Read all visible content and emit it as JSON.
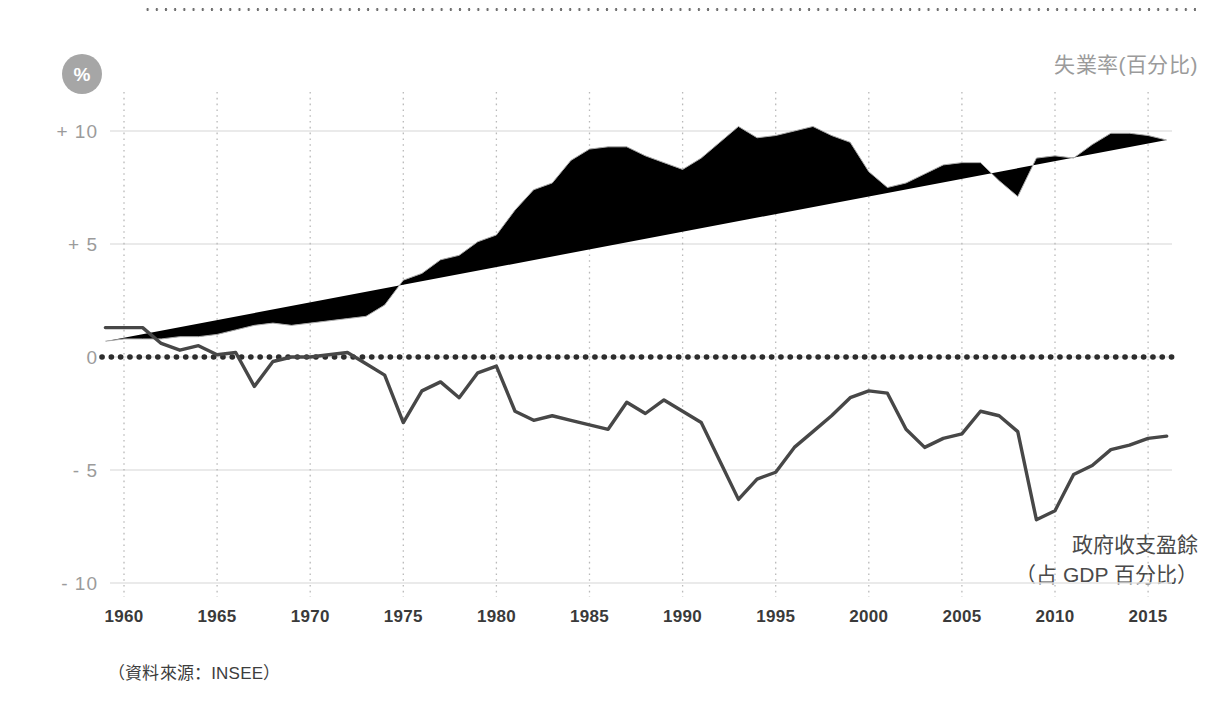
{
  "badge": {
    "symbol": "%"
  },
  "legend": {
    "unemployment": "失業率(百分比)",
    "budget_line1": "政府收支盈餘",
    "budget_line2": "（占 GDP 百分比）"
  },
  "source_note": "（資料來源：INSEE）",
  "chart_data": {
    "type": "line",
    "title": "",
    "xlabel": "",
    "ylabel": "%",
    "xlim": [
      1959,
      2016
    ],
    "ylim": [
      -11.5,
      12.0
    ],
    "yticks": [
      10,
      5,
      0,
      -5,
      -10
    ],
    "ytick_labels": [
      "+ 10",
      "+ 5",
      "0",
      "- 5",
      "- 10"
    ],
    "xticks": [
      1960,
      1965,
      1970,
      1975,
      1980,
      1985,
      1990,
      1995,
      2000,
      2005,
      2010,
      2015
    ],
    "xtick_labels": [
      "1960",
      "1965",
      "1970",
      "1975",
      "1980",
      "1985",
      "1990",
      "1995",
      "2000",
      "2005",
      "2010",
      "2015"
    ],
    "grid": {
      "horizontal": true,
      "vertical": true,
      "zero_reference": 0
    },
    "legend_position": "inline-annotations",
    "colors": {
      "unemployment": "#a9a9a9",
      "budget": "#474747",
      "zero_line": "#2d2d2d",
      "grid": "#e3e3e3"
    },
    "x": [
      1959,
      1960,
      1961,
      1962,
      1963,
      1964,
      1965,
      1966,
      1967,
      1968,
      1969,
      1970,
      1971,
      1972,
      1973,
      1974,
      1975,
      1976,
      1977,
      1978,
      1979,
      1980,
      1981,
      1982,
      1983,
      1984,
      1985,
      1986,
      1987,
      1988,
      1989,
      1990,
      1991,
      1992,
      1993,
      1994,
      1995,
      1996,
      1997,
      1998,
      1999,
      2000,
      2001,
      2002,
      2003,
      2004,
      2005,
      2006,
      2007,
      2008,
      2009,
      2010,
      2011,
      2012,
      2013,
      2014,
      2015,
      2016
    ],
    "series": [
      {
        "name": "失業率(百分比)",
        "key": "unemployment",
        "color": "#a9a9a9",
        "values": [
          0.7,
          0.8,
          0.8,
          0.8,
          0.9,
          0.9,
          1.0,
          1.2,
          1.4,
          1.5,
          1.4,
          1.5,
          1.6,
          1.7,
          1.8,
          2.3,
          3.4,
          3.7,
          4.3,
          4.5,
          5.1,
          5.4,
          6.5,
          7.4,
          7.7,
          8.7,
          9.2,
          9.3,
          9.3,
          8.9,
          8.6,
          8.3,
          8.8,
          9.5,
          10.2,
          9.7,
          9.8,
          10.0,
          10.2,
          9.8,
          9.5,
          8.2,
          7.5,
          7.7,
          8.1,
          8.5,
          8.6,
          8.6,
          7.8,
          7.1,
          8.8,
          8.9,
          8.8,
          9.4,
          9.9,
          9.9,
          9.8,
          9.6
        ]
      },
      {
        "name": "政府收支盈餘（占 GDP 百分比）",
        "key": "budget",
        "color": "#474747",
        "values": [
          1.3,
          1.3,
          1.3,
          0.6,
          0.3,
          0.5,
          0.1,
          0.2,
          -1.3,
          -0.2,
          0.0,
          0.0,
          0.1,
          0.2,
          -0.3,
          -0.8,
          -2.9,
          -1.5,
          -1.1,
          -1.8,
          -0.7,
          -0.4,
          -2.4,
          -2.8,
          -2.6,
          -2.8,
          -3.0,
          -3.2,
          -2.0,
          -2.5,
          -1.9,
          -2.4,
          -2.9,
          -4.6,
          -6.3,
          -5.4,
          -5.1,
          -4.0,
          -3.3,
          -2.6,
          -1.8,
          -1.5,
          -1.6,
          -3.2,
          -4.0,
          -3.6,
          -3.4,
          -2.4,
          -2.6,
          -3.3,
          -7.2,
          -6.8,
          -5.2,
          -4.8,
          -4.1,
          -3.9,
          -3.6,
          -3.5
        ]
      }
    ]
  }
}
